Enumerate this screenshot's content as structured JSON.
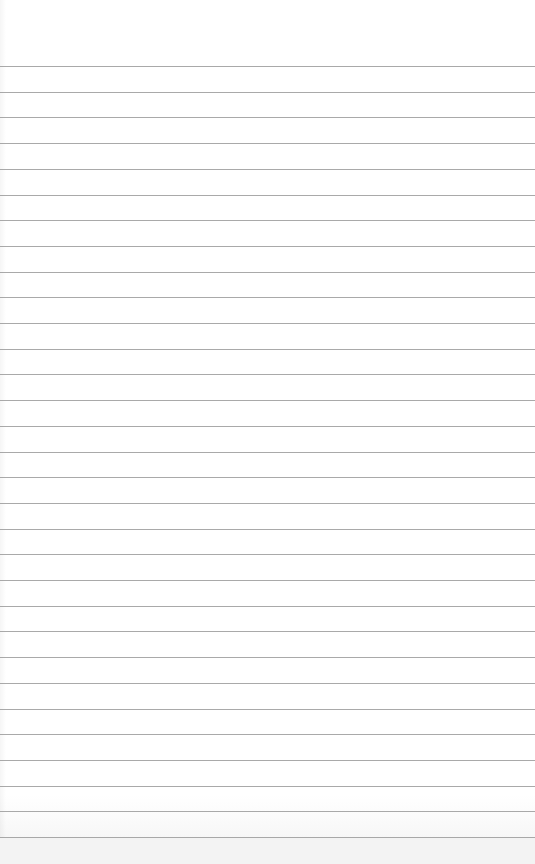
{
  "page": {
    "type": "lined-paper",
    "width": 535,
    "height": 864,
    "background_color": "#ffffff",
    "line_color": "#9a9a9a",
    "line_count": 31,
    "first_line_y": 66,
    "line_spacing": 25.7,
    "bottom_band_color": "#f3f3f3",
    "text": []
  }
}
